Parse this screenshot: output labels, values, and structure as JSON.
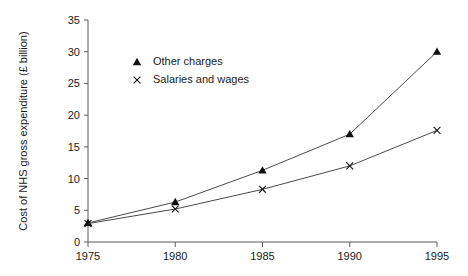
{
  "chart_data": {
    "type": "line",
    "title": "",
    "xlabel": "",
    "ylabel": "Cost of NHS gross expenditure (£ billion)",
    "x": [
      1975,
      1980,
      1985,
      1990,
      1995
    ],
    "xtick_labels": [
      "1975",
      "1980",
      "1985",
      "1990",
      "1995"
    ],
    "xlim": [
      1975,
      1995
    ],
    "ylim": [
      0,
      35
    ],
    "ytick_labels": [
      "0",
      "5",
      "10",
      "15",
      "20",
      "25",
      "30",
      "35"
    ],
    "yticks": [
      0,
      5,
      10,
      15,
      20,
      25,
      30,
      35
    ],
    "grid": false,
    "legend_position": "upper-left-inside",
    "series": [
      {
        "name": "Other charges",
        "marker": "triangle",
        "values": [
          3.0,
          6.3,
          11.3,
          17.0,
          30.0
        ]
      },
      {
        "name": "Salaries and wages",
        "marker": "cross",
        "values": [
          2.9,
          5.2,
          8.3,
          12.0,
          17.6
        ]
      }
    ],
    "colors": {
      "line": "#4a4a4a",
      "marker": "#111111",
      "axis": "#5b5b5b",
      "text": "#1a1a1a",
      "background": "#ffffff"
    }
  }
}
